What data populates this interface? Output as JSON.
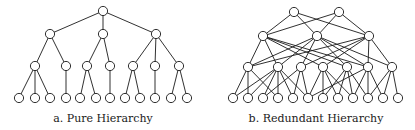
{
  "figure": {
    "background": "#ffffff",
    "stroke_color": "#1a1a1a",
    "node_radius": 4.6
  },
  "panels": [
    {
      "id": "pure",
      "caption": "a. Pure Hierarchy",
      "caption_x": 103,
      "nodes": [
        [
          103,
          11
        ],
        [
          50,
          34
        ],
        [
          103,
          34
        ],
        [
          156,
          34
        ],
        [
          35,
          66
        ],
        [
          66,
          66
        ],
        [
          87,
          66
        ],
        [
          110,
          66
        ],
        [
          133,
          66
        ],
        [
          155,
          66
        ],
        [
          179,
          66
        ],
        [
          19,
          98
        ],
        [
          35,
          98
        ],
        [
          50,
          98
        ],
        [
          66,
          98
        ],
        [
          80,
          98
        ],
        [
          96,
          98
        ],
        [
          110,
          98
        ],
        [
          125,
          98
        ],
        [
          140,
          98
        ],
        [
          155,
          98
        ],
        [
          171,
          98
        ],
        [
          187,
          98
        ]
      ],
      "edges": [
        [
          0,
          1
        ],
        [
          0,
          2
        ],
        [
          0,
          3
        ],
        [
          1,
          4
        ],
        [
          1,
          5
        ],
        [
          2,
          6
        ],
        [
          2,
          7
        ],
        [
          3,
          8
        ],
        [
          3,
          9
        ],
        [
          3,
          10
        ],
        [
          4,
          11
        ],
        [
          4,
          12
        ],
        [
          4,
          13
        ],
        [
          5,
          14
        ],
        [
          6,
          15
        ],
        [
          6,
          16
        ],
        [
          7,
          17
        ],
        [
          8,
          18
        ],
        [
          8,
          19
        ],
        [
          9,
          20
        ],
        [
          10,
          21
        ],
        [
          10,
          22
        ]
      ]
    },
    {
      "id": "redundant",
      "caption": "b. Redundant Hierarchy",
      "caption_x": 316,
      "nodes": [
        [
          294,
          12
        ],
        [
          339,
          12
        ],
        [
          263,
          36
        ],
        [
          317,
          36
        ],
        [
          369,
          36
        ],
        [
          248,
          67
        ],
        [
          278,
          67
        ],
        [
          301,
          67
        ],
        [
          323,
          67
        ],
        [
          347,
          67
        ],
        [
          368,
          67
        ],
        [
          392,
          67
        ],
        [
          233,
          98
        ],
        [
          248,
          98
        ],
        [
          263,
          98
        ],
        [
          278,
          98
        ],
        [
          293,
          98
        ],
        [
          308,
          98
        ],
        [
          323,
          98
        ],
        [
          338,
          98
        ],
        [
          353,
          98
        ],
        [
          368,
          98
        ],
        [
          383,
          98
        ],
        [
          398,
          98
        ]
      ],
      "edges": [
        [
          0,
          2
        ],
        [
          0,
          3
        ],
        [
          0,
          4
        ],
        [
          1,
          2
        ],
        [
          1,
          3
        ],
        [
          1,
          4
        ],
        [
          2,
          5
        ],
        [
          2,
          6
        ],
        [
          2,
          8
        ],
        [
          2,
          9
        ],
        [
          2,
          10
        ],
        [
          3,
          5
        ],
        [
          3,
          6
        ],
        [
          3,
          7
        ],
        [
          3,
          9
        ],
        [
          3,
          10
        ],
        [
          3,
          11
        ],
        [
          4,
          5
        ],
        [
          4,
          7
        ],
        [
          4,
          8
        ],
        [
          4,
          10
        ],
        [
          4,
          11
        ],
        [
          5,
          12
        ],
        [
          5,
          13
        ],
        [
          5,
          15
        ],
        [
          6,
          13
        ],
        [
          6,
          14
        ],
        [
          6,
          15
        ],
        [
          6,
          16
        ],
        [
          6,
          17
        ],
        [
          6,
          12
        ],
        [
          7,
          14
        ],
        [
          7,
          16
        ],
        [
          7,
          17
        ],
        [
          8,
          17
        ],
        [
          8,
          18
        ],
        [
          8,
          19
        ],
        [
          8,
          20
        ],
        [
          9,
          18
        ],
        [
          9,
          19
        ],
        [
          9,
          20
        ],
        [
          9,
          21
        ],
        [
          10,
          20
        ],
        [
          10,
          21
        ],
        [
          10,
          22
        ],
        [
          10,
          17
        ],
        [
          11,
          21
        ],
        [
          11,
          22
        ],
        [
          11,
          23
        ]
      ]
    }
  ]
}
